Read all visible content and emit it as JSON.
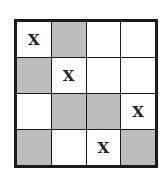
{
  "grid": {
    "rows": 4,
    "cols": 4,
    "shaded_color": "#bdbdbd",
    "cells": [
      [
        {
          "mark": "X",
          "shaded": false
        },
        {
          "mark": "",
          "shaded": true
        },
        {
          "mark": "",
          "shaded": false
        },
        {
          "mark": "",
          "shaded": false
        }
      ],
      [
        {
          "mark": "",
          "shaded": true
        },
        {
          "mark": "X",
          "shaded": false
        },
        {
          "mark": "",
          "shaded": false
        },
        {
          "mark": "",
          "shaded": false
        }
      ],
      [
        {
          "mark": "",
          "shaded": false
        },
        {
          "mark": "",
          "shaded": true
        },
        {
          "mark": "",
          "shaded": true
        },
        {
          "mark": "X",
          "shaded": false
        }
      ],
      [
        {
          "mark": "",
          "shaded": true
        },
        {
          "mark": "",
          "shaded": false
        },
        {
          "mark": "X",
          "shaded": false
        },
        {
          "mark": "",
          "shaded": true
        }
      ]
    ]
  }
}
